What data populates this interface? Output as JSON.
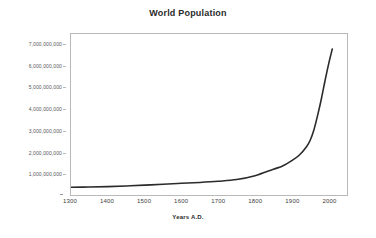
{
  "chart_data": {
    "type": "line",
    "title": "World Population",
    "xlabel": "Years A.D.",
    "ylabel": "",
    "xlim": [
      1300,
      2050
    ],
    "ylim": [
      0,
      7500000000
    ],
    "grid": false,
    "legend": "none",
    "line_color": "#2b2b2b",
    "frame_color": "#b9b9b9",
    "background": "#ffffff",
    "x_ticks": [
      {
        "value": 1300,
        "label": "1300"
      },
      {
        "value": 1400,
        "label": "1400"
      },
      {
        "value": 1500,
        "label": "1500"
      },
      {
        "value": 1600,
        "label": "1600"
      },
      {
        "value": 1700,
        "label": "1700"
      },
      {
        "value": 1800,
        "label": "1800"
      },
      {
        "value": 1900,
        "label": "1900"
      },
      {
        "value": 2000,
        "label": "2000"
      }
    ],
    "y_ticks": [
      {
        "value": 7000000000,
        "label": "7,000,000,000"
      },
      {
        "value": 6000000000,
        "label": "6,000,000,000"
      },
      {
        "value": 5000000000,
        "label": "5,000,000,000"
      },
      {
        "value": 4000000000,
        "label": "4,000,000,000"
      },
      {
        "value": 3000000000,
        "label": "3,000,000,000"
      },
      {
        "value": 2000000000,
        "label": "2,000,000,000"
      },
      {
        "value": 1000000000,
        "label": "1,000,000,000"
      }
    ],
    "series": [
      {
        "name": "World Population",
        "x": [
          1300,
          1350,
          1400,
          1450,
          1500,
          1550,
          1600,
          1650,
          1700,
          1750,
          1800,
          1850,
          1875,
          1900,
          1920,
          1940,
          1950,
          1960,
          1970,
          1980,
          1990,
          2000,
          2010
        ],
        "values": [
          360000000,
          370000000,
          390000000,
          420000000,
          460000000,
          500000000,
          545000000,
          585000000,
          640000000,
          720000000,
          900000000,
          1200000000,
          1350000000,
          1600000000,
          1850000000,
          2250000000,
          2550000000,
          3030000000,
          3700000000,
          4450000000,
          5300000000,
          6100000000,
          6800000000
        ]
      }
    ]
  }
}
